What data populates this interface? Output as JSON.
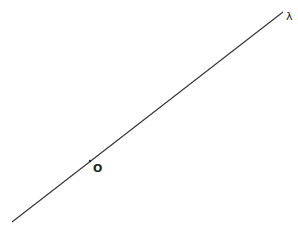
{
  "diagram": {
    "line": {
      "label": "λ",
      "x1": 12,
      "y1": 222,
      "x2": 283,
      "y2": 12,
      "color": "#333333"
    },
    "point": {
      "label": "O",
      "x": 90,
      "y": 161
    }
  }
}
